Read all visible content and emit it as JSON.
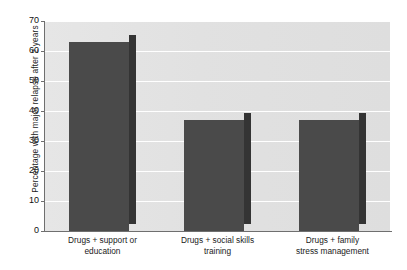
{
  "chart_data": {
    "type": "bar",
    "title": "",
    "xlabel": "",
    "ylabel": "Percentage with major relapse after 2 years",
    "categories": [
      "Drugs + support or education",
      "Drugs + social skills training",
      "Drugs + family stress management"
    ],
    "category_lines": [
      [
        "Drugs + support or",
        "education"
      ],
      [
        "Drugs + social skills",
        "training"
      ],
      [
        "Drugs + family",
        "stress management"
      ]
    ],
    "values": [
      63,
      37,
      37
    ],
    "ylim": [
      0,
      70
    ],
    "ytick_labels": [
      "0",
      "10",
      "20",
      "30",
      "40",
      "50",
      "60",
      "70"
    ],
    "ytick_values": [
      0,
      10,
      20,
      30,
      40,
      50,
      60,
      70
    ],
    "grid": true,
    "legend": false,
    "style": "3d-bars",
    "colors": {
      "bar_front": "#4a4a4a",
      "bar_side": "#343434",
      "bar_top": "#3f3f3f",
      "plot_background": "#e3e3e3",
      "gridline": "#ffffff",
      "axis": "#6f6f6f",
      "text": "#1a1a1a"
    }
  }
}
